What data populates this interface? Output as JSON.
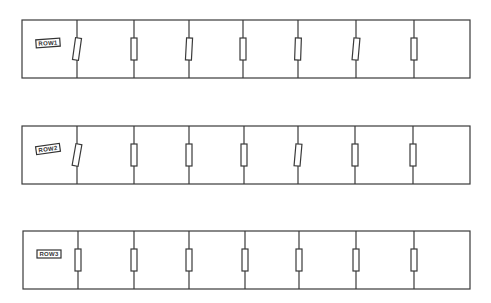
{
  "diagram": {
    "type": "resistor-ladder-rows",
    "stroke_color": "#3a3a3a",
    "background": "#ffffff",
    "rows": [
      {
        "label": "ROW1",
        "label_rotation": -4,
        "box": {
          "x": 22,
          "y": 20,
          "w": 448,
          "h": 58
        },
        "dividers": [
          77,
          134,
          189,
          243,
          298,
          356,
          414
        ],
        "resistor_tilts": [
          8,
          0,
          3,
          0,
          2,
          5,
          0
        ]
      },
      {
        "label": "ROW2",
        "label_rotation": -8,
        "box": {
          "x": 22,
          "y": 126,
          "w": 448,
          "h": 58
        },
        "dividers": [
          77,
          134,
          189,
          244,
          298,
          355,
          413
        ],
        "resistor_tilts": [
          10,
          0,
          0,
          0,
          5,
          0,
          0
        ]
      },
      {
        "label": "ROW3",
        "label_rotation": 0,
        "box": {
          "x": 23,
          "y": 231,
          "w": 447,
          "h": 58
        },
        "dividers": [
          78,
          134,
          189,
          245,
          299,
          356,
          414
        ],
        "resistor_tilts": [
          0,
          0,
          0,
          0,
          0,
          0,
          0
        ]
      }
    ]
  }
}
